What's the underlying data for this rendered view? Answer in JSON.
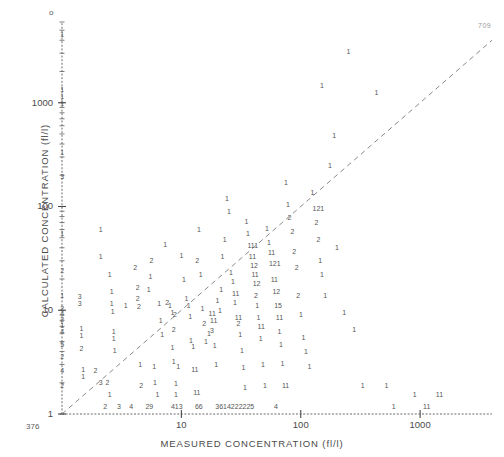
{
  "chart_data": {
    "type": "scatter",
    "title": "",
    "subtitle": "",
    "xlabel": "MEASURED CONCENTRATION (fl/l)",
    "ylabel": "CALCULATED CONCENTRATION (fl/l)",
    "xscale": "log",
    "yscale": "log",
    "xlim": [
      1,
      4000
    ],
    "ylim": [
      1,
      6000
    ],
    "grid": false,
    "legend": null,
    "xticks": [
      {
        "value": 10,
        "label": "10"
      },
      {
        "value": 100,
        "label": "100"
      },
      {
        "value": 1000,
        "label": "1000"
      }
    ],
    "yticks": [
      {
        "value": 1,
        "label": "1"
      },
      {
        "value": 10,
        "label": "10"
      },
      {
        "value": 100,
        "label": "100"
      },
      {
        "value": 1000,
        "label": "1000"
      }
    ],
    "encoding_note": "Plotted glyphs are digit characters giving the number of coincident observations at that cell; '1' = one point.",
    "reference_line": {
      "style": "dashed",
      "description": "identity line y = x",
      "from": [
        1,
        1
      ],
      "to": [
        4000,
        4000
      ]
    },
    "origin_overplot_count": "376",
    "top_axis_marker": "o",
    "points": [
      {
        "x": 1.0,
        "y": 4500,
        "n": "1"
      },
      {
        "x": 1.0,
        "y": 1350,
        "n": "1"
      },
      {
        "x": 1.0,
        "y": 1150,
        "n": "1"
      },
      {
        "x": 1.0,
        "y": 980,
        "n": "1"
      },
      {
        "x": 1.0,
        "y": 330,
        "n": "1"
      },
      {
        "x": 1.0,
        "y": 195,
        "n": "3"
      },
      {
        "x": 1.0,
        "y": 55,
        "n": "1"
      },
      {
        "x": 1.0,
        "y": 24,
        "n": "2"
      },
      {
        "x": 1.0,
        "y": 14,
        "n": "1"
      },
      {
        "x": 1.0,
        "y": 10.5,
        "n": "2"
      },
      {
        "x": 1.0,
        "y": 9.4,
        "n": "4"
      },
      {
        "x": 1.0,
        "y": 8.2,
        "n": "2"
      },
      {
        "x": 1.0,
        "y": 7.1,
        "n": "1"
      },
      {
        "x": 1.0,
        "y": 6.2,
        "n": "4"
      },
      {
        "x": 1.0,
        "y": 4.7,
        "n": "5"
      },
      {
        "x": 1.0,
        "y": 3.6,
        "n": "2"
      },
      {
        "x": 1.0,
        "y": 2.6,
        "n": "4"
      },
      {
        "x": 1.0,
        "y": 1.9,
        "n": "2"
      },
      {
        "x": 1.4,
        "y": 13.5,
        "n": "3"
      },
      {
        "x": 1.4,
        "y": 11.5,
        "n": "3"
      },
      {
        "x": 1.45,
        "y": 6.6,
        "n": "1"
      },
      {
        "x": 1.45,
        "y": 5.7,
        "n": "1"
      },
      {
        "x": 1.45,
        "y": 4.3,
        "n": "2"
      },
      {
        "x": 1.5,
        "y": 2.7,
        "n": "1"
      },
      {
        "x": 1.5,
        "y": 2.3,
        "n": "1"
      },
      {
        "x": 1.9,
        "y": 2.6,
        "n": "2"
      },
      {
        "x": 2.1,
        "y": 2.0,
        "n": "3"
      },
      {
        "x": 2.4,
        "y": 2.0,
        "n": "2"
      },
      {
        "x": 2.5,
        "y": 1.55,
        "n": "1"
      },
      {
        "x": 2.1,
        "y": 60,
        "n": "1"
      },
      {
        "x": 2.1,
        "y": 33,
        "n": "1"
      },
      {
        "x": 2.5,
        "y": 22,
        "n": "1"
      },
      {
        "x": 2.6,
        "y": 15,
        "n": "1"
      },
      {
        "x": 2.6,
        "y": 11.5,
        "n": "1"
      },
      {
        "x": 2.65,
        "y": 9.8,
        "n": "1"
      },
      {
        "x": 2.7,
        "y": 6.3,
        "n": "1"
      },
      {
        "x": 2.7,
        "y": 5.3,
        "n": "1"
      },
      {
        "x": 2.75,
        "y": 4.1,
        "n": "1"
      },
      {
        "x": 3.4,
        "y": 11.0,
        "n": "1"
      },
      {
        "x": 4.3,
        "y": 16.5,
        "n": "2"
      },
      {
        "x": 4.3,
        "y": 13.0,
        "n": "2"
      },
      {
        "x": 4.4,
        "y": 10.8,
        "n": "2"
      },
      {
        "x": 4.1,
        "y": 26,
        "n": "2"
      },
      {
        "x": 4.5,
        "y": 3.0,
        "n": "1"
      },
      {
        "x": 4.6,
        "y": 1.9,
        "n": "2"
      },
      {
        "x": 5.3,
        "y": 16.0,
        "n": "1"
      },
      {
        "x": 5.5,
        "y": 21,
        "n": "1"
      },
      {
        "x": 5.6,
        "y": 30,
        "n": "2"
      },
      {
        "x": 5.9,
        "y": 2.9,
        "n": "1"
      },
      {
        "x": 6.0,
        "y": 2.0,
        "n": "1"
      },
      {
        "x": 6.3,
        "y": 1.55,
        "n": "1"
      },
      {
        "x": 6.5,
        "y": 11.5,
        "n": "1"
      },
      {
        "x": 6.7,
        "y": 8.0,
        "n": "1"
      },
      {
        "x": 6.9,
        "y": 5.8,
        "n": "1"
      },
      {
        "x": 7.3,
        "y": 43,
        "n": "1"
      },
      {
        "x": 7.6,
        "y": 12.0,
        "n": "2"
      },
      {
        "x": 8.0,
        "y": 11.0,
        "n": "1"
      },
      {
        "x": 8.4,
        "y": 9.6,
        "n": "1"
      },
      {
        "x": 8.8,
        "y": 9.0,
        "n": "2"
      },
      {
        "x": 8.6,
        "y": 6.5,
        "n": "2"
      },
      {
        "x": 8.4,
        "y": 4.4,
        "n": "1"
      },
      {
        "x": 8.6,
        "y": 3.2,
        "n": "1"
      },
      {
        "x": 9.4,
        "y": 2.9,
        "n": "1"
      },
      {
        "x": 9.0,
        "y": 1.95,
        "n": "1"
      },
      {
        "x": 9.0,
        "y": 1.55,
        "n": "1"
      },
      {
        "x": 10.0,
        "y": 34,
        "n": "1"
      },
      {
        "x": 10.5,
        "y": 20,
        "n": "1"
      },
      {
        "x": 11.0,
        "y": 13.0,
        "n": "1"
      },
      {
        "x": 11.5,
        "y": 11.2,
        "n": "1"
      },
      {
        "x": 11.8,
        "y": 8.7,
        "n": "1"
      },
      {
        "x": 12.0,
        "y": 5.1,
        "n": "1"
      },
      {
        "x": 12.5,
        "y": 4.5,
        "n": "1"
      },
      {
        "x": 12.5,
        "y": 2.7,
        "n": "11"
      },
      {
        "x": 13.0,
        "y": 1.6,
        "n": "11"
      },
      {
        "x": 13.5,
        "y": 30,
        "n": "2"
      },
      {
        "x": 14.0,
        "y": 60,
        "n": "1"
      },
      {
        "x": 14.5,
        "y": 22,
        "n": "1"
      },
      {
        "x": 15.0,
        "y": 10.5,
        "n": "1"
      },
      {
        "x": 15.5,
        "y": 7.5,
        "n": "2"
      },
      {
        "x": 16.0,
        "y": 5.0,
        "n": "1"
      },
      {
        "x": 17.0,
        "y": 6.0,
        "n": "1"
      },
      {
        "x": 17.5,
        "y": 9.4,
        "n": "11"
      },
      {
        "x": 18.0,
        "y": 8.0,
        "n": "11"
      },
      {
        "x": 18.0,
        "y": 6.4,
        "n": "3"
      },
      {
        "x": 19.0,
        "y": 4.6,
        "n": "1"
      },
      {
        "x": 19.5,
        "y": 3.0,
        "n": "1"
      },
      {
        "x": 20.0,
        "y": 12.5,
        "n": "1"
      },
      {
        "x": 21.0,
        "y": 10.0,
        "n": "1"
      },
      {
        "x": 21.5,
        "y": 16.0,
        "n": "1"
      },
      {
        "x": 22.0,
        "y": 33,
        "n": "1"
      },
      {
        "x": 23.0,
        "y": 48,
        "n": "1"
      },
      {
        "x": 24.0,
        "y": 120,
        "n": "1"
      },
      {
        "x": 25.0,
        "y": 90,
        "n": "1"
      },
      {
        "x": 26.0,
        "y": 23,
        "n": "1"
      },
      {
        "x": 27.0,
        "y": 19,
        "n": "1"
      },
      {
        "x": 27.5,
        "y": 14.5,
        "n": "11"
      },
      {
        "x": 28.0,
        "y": 12.0,
        "n": "1"
      },
      {
        "x": 29.0,
        "y": 8.6,
        "n": "11"
      },
      {
        "x": 30.0,
        "y": 7.5,
        "n": "2"
      },
      {
        "x": 31.0,
        "y": 5.8,
        "n": "1"
      },
      {
        "x": 32.0,
        "y": 4.1,
        "n": "1"
      },
      {
        "x": 33.0,
        "y": 2.8,
        "n": "1"
      },
      {
        "x": 34.0,
        "y": 1.8,
        "n": "1"
      },
      {
        "x": 35.0,
        "y": 72,
        "n": "1"
      },
      {
        "x": 36.0,
        "y": 55,
        "n": "1"
      },
      {
        "x": 37.0,
        "y": 42,
        "n": "111"
      },
      {
        "x": 38.0,
        "y": 33,
        "n": "11"
      },
      {
        "x": 39.0,
        "y": 27,
        "n": "12"
      },
      {
        "x": 40.0,
        "y": 22,
        "n": "11"
      },
      {
        "x": 41.0,
        "y": 18,
        "n": "12"
      },
      {
        "x": 42.0,
        "y": 14.0,
        "n": "2"
      },
      {
        "x": 43.0,
        "y": 11.0,
        "n": "1"
      },
      {
        "x": 44.0,
        "y": 8.5,
        "n": "1"
      },
      {
        "x": 45.0,
        "y": 7.0,
        "n": "11"
      },
      {
        "x": 46.0,
        "y": 5.4,
        "n": "1"
      },
      {
        "x": 48.0,
        "y": 3.0,
        "n": "1"
      },
      {
        "x": 50.0,
        "y": 1.9,
        "n": "1"
      },
      {
        "x": 52.0,
        "y": 62,
        "n": "1"
      },
      {
        "x": 54.0,
        "y": 45,
        "n": "1"
      },
      {
        "x": 55.0,
        "y": 36,
        "n": "11"
      },
      {
        "x": 56.0,
        "y": 28,
        "n": "121"
      },
      {
        "x": 58.0,
        "y": 20,
        "n": "11"
      },
      {
        "x": 60.0,
        "y": 15.0,
        "n": "12"
      },
      {
        "x": 62.0,
        "y": 11.0,
        "n": "15"
      },
      {
        "x": 64.0,
        "y": 8.6,
        "n": "11"
      },
      {
        "x": 66.0,
        "y": 6.3,
        "n": "1"
      },
      {
        "x": 68.0,
        "y": 4.7,
        "n": "1"
      },
      {
        "x": 70.0,
        "y": 3.1,
        "n": "1"
      },
      {
        "x": 72.0,
        "y": 1.9,
        "n": "11"
      },
      {
        "x": 75.0,
        "y": 170,
        "n": "1"
      },
      {
        "x": 78.0,
        "y": 105,
        "n": "1"
      },
      {
        "x": 80.0,
        "y": 78,
        "n": "2"
      },
      {
        "x": 85.0,
        "y": 58,
        "n": "2"
      },
      {
        "x": 88.0,
        "y": 37,
        "n": "2"
      },
      {
        "x": 92.0,
        "y": 26,
        "n": "2"
      },
      {
        "x": 95.0,
        "y": 14.0,
        "n": "2"
      },
      {
        "x": 100.0,
        "y": 9.0,
        "n": "1"
      },
      {
        "x": 105.0,
        "y": 5.5,
        "n": "1"
      },
      {
        "x": 110.0,
        "y": 4.0,
        "n": "1"
      },
      {
        "x": 118.0,
        "y": 2.9,
        "n": "1"
      },
      {
        "x": 125.0,
        "y": 135,
        "n": "1"
      },
      {
        "x": 130.0,
        "y": 95,
        "n": "121"
      },
      {
        "x": 135.0,
        "y": 70,
        "n": "2"
      },
      {
        "x": 140.0,
        "y": 48,
        "n": "2"
      },
      {
        "x": 145.0,
        "y": 30,
        "n": "1"
      },
      {
        "x": 150.0,
        "y": 22,
        "n": "1"
      },
      {
        "x": 160.0,
        "y": 14.0,
        "n": "1"
      },
      {
        "x": 175.0,
        "y": 250,
        "n": "1"
      },
      {
        "x": 190.0,
        "y": 480,
        "n": "1"
      },
      {
        "x": 200.0,
        "y": 40,
        "n": "1"
      },
      {
        "x": 230.0,
        "y": 9.5,
        "n": "1"
      },
      {
        "x": 280.0,
        "y": 6.5,
        "n": "1"
      },
      {
        "x": 330.0,
        "y": 1.9,
        "n": "1"
      },
      {
        "x": 430.0,
        "y": 1250,
        "n": "1"
      },
      {
        "x": 520.0,
        "y": 1.9,
        "n": "1"
      },
      {
        "x": 900.0,
        "y": 1.55,
        "n": "1"
      },
      {
        "x": 1400.0,
        "y": 1.55,
        "n": "11"
      },
      {
        "x": 250.0,
        "y": 3100,
        "n": "1"
      },
      {
        "x": 150.0,
        "y": 1450,
        "n": "1"
      }
    ],
    "baseline_counts": [
      {
        "x": 2.3,
        "label": "2"
      },
      {
        "x": 3.0,
        "label": "3"
      },
      {
        "x": 3.8,
        "label": "4"
      },
      {
        "x": 5.2,
        "label": "29"
      },
      {
        "x": 8.5,
        "label": "413"
      },
      {
        "x": 13.5,
        "label": "66"
      },
      {
        "x": 20.0,
        "label": "3614222225"
      },
      {
        "x": 62.0,
        "label": "4"
      },
      {
        "x": 600.0,
        "label": "1"
      },
      {
        "x": 1100.0,
        "label": "11"
      }
    ],
    "baseline_note": "Counts of observations with calculated concentration pinned at the y = 1 floor."
  },
  "corner_note": "709"
}
